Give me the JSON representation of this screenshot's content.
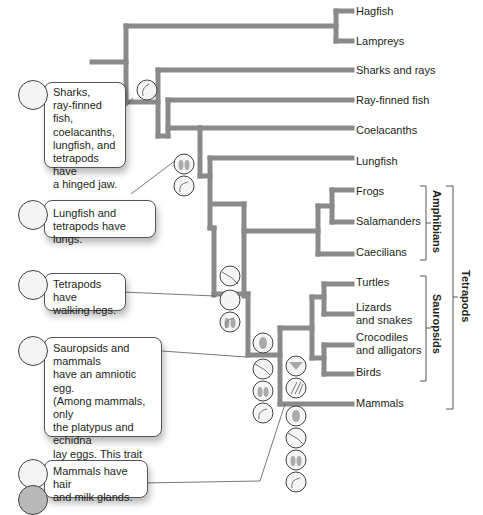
{
  "colors": {
    "branch": "#8a8a8a",
    "text": "#231f20",
    "leader": "#555555",
    "icon_fill": "#a8a8a8"
  },
  "taxa": [
    {
      "label": "Hagfish"
    },
    {
      "label": "Lampreys"
    },
    {
      "label": "Sharks and rays"
    },
    {
      "label": "Ray-finned fish"
    },
    {
      "label": "Coelacanths"
    },
    {
      "label": "Lungfish"
    },
    {
      "label": "Frogs"
    },
    {
      "label": "Salamanders"
    },
    {
      "label": "Caecilians"
    },
    {
      "label": "Turtles"
    },
    {
      "label": "Lizards and snakes",
      "line1": "Lizards",
      "line2": "and snakes"
    },
    {
      "label": "Crocodiles and alligators",
      "line1": "Crocodiles",
      "line2": "and alligators"
    },
    {
      "label": "Birds"
    },
    {
      "label": "Mammals"
    }
  ],
  "groups": {
    "amphibians": "Amphibians",
    "sauropsids": "Sauropsids",
    "tetrapods": "Tetrapods"
  },
  "callouts": [
    {
      "id": "jaw",
      "icon": "jaw-icon",
      "text": "Sharks, ray-finned fish, coelacanths, lungfish, and tetrapods have a hinged jaw.",
      "lines": [
        "Sharks,",
        "ray-finned fish,",
        "coelacanths,",
        "lungfish, and",
        "tetrapods have",
        "a hinged jaw."
      ]
    },
    {
      "id": "lungs",
      "icon": "lungs-icon",
      "text": "Lungfish and tetrapods have lungs.",
      "lines": [
        "Lungfish and",
        "tetrapods have lungs."
      ]
    },
    {
      "id": "legs",
      "icon": "leg-icon",
      "text": "Tetrapods have walking legs.",
      "lines": [
        "Tetrapods have",
        "walking legs."
      ]
    },
    {
      "id": "egg",
      "icon": "amniotic-egg-icon",
      "text": "Sauropsids and mammals have an amniotic egg. (Among mammals, only the platypus and echidna lay eggs. This trait has been lost in other mammals.)",
      "lines": [
        "Sauropsids and mammals",
        "have an amniotic egg.",
        "(Among mammals, only",
        "the platypus and echidna",
        "lay eggs. This trait has",
        "been lost in other",
        "mammals.)"
      ]
    },
    {
      "id": "hair",
      "icon": "hair-icon",
      "text": "Mammals have hair and milk glands.",
      "lines": [
        "Mammals have hair",
        "and milk glands."
      ],
      "extra_icon": "milk-gland-icon"
    }
  ]
}
